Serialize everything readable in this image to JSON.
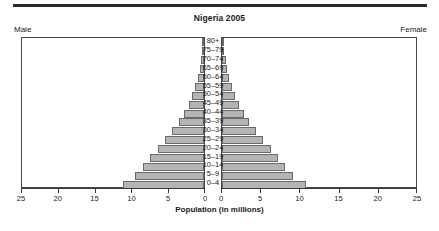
{
  "header": {
    "title": "Nigeria 2005",
    "male_label": "Male",
    "female_label": "Female"
  },
  "axis": {
    "xlabel": "Population (in millions)",
    "ticks_male": [
      "25",
      "20",
      "15",
      "10",
      "5",
      "0"
    ],
    "ticks_female": [
      "0",
      "5",
      "10",
      "15",
      "20",
      "25"
    ]
  },
  "chart_data": {
    "type": "bar",
    "subtype": "population-pyramid",
    "title": "Nigeria 2005",
    "xlabel": "Population (in millions)",
    "ylabel": "",
    "xlim": [
      0,
      25
    ],
    "grid": false,
    "legend": [
      "Male",
      "Female"
    ],
    "legend_position": "top-corners",
    "categories": [
      "80+",
      "75–79",
      "70–74",
      "65–69",
      "60–64",
      "55–59",
      "50–54",
      "45–49",
      "40–44",
      "35–39",
      "30–34",
      "25–29",
      "20–24",
      "15–19",
      "10–14",
      "5–9",
      "0–4"
    ],
    "series": [
      {
        "name": "Male",
        "side": "left",
        "values": [
          0.15,
          0.25,
          0.4,
          0.6,
          0.85,
          1.2,
          1.6,
          2.1,
          2.7,
          3.4,
          4.3,
          5.3,
          6.3,
          7.4,
          8.3,
          9.4,
          11.0
        ]
      },
      {
        "name": "Female",
        "side": "right",
        "values": [
          0.18,
          0.28,
          0.45,
          0.65,
          0.9,
          1.25,
          1.65,
          2.15,
          2.75,
          3.45,
          4.3,
          5.2,
          6.2,
          7.2,
          8.0,
          9.1,
          10.7
        ]
      }
    ],
    "colors": {
      "bar_fill": "#b4b4b4",
      "bar_stroke": "#6a6a6a",
      "axis": "#3a3a3a",
      "text": "#1a1a1a"
    }
  }
}
